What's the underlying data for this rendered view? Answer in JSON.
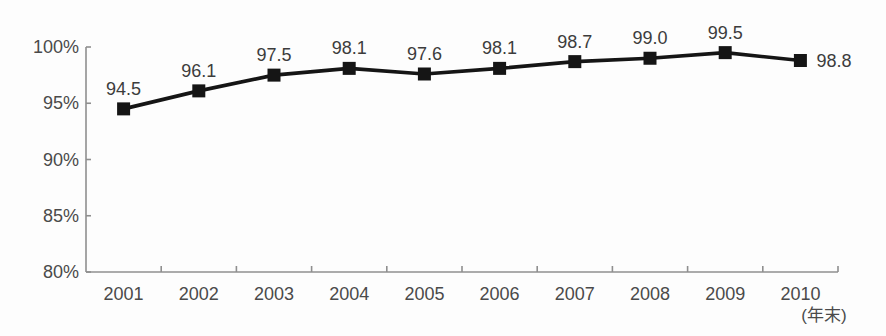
{
  "chart_data": {
    "type": "line",
    "categories": [
      "2001",
      "2002",
      "2003",
      "2004",
      "2005",
      "2006",
      "2007",
      "2008",
      "2009",
      "2010"
    ],
    "values": [
      94.5,
      96.1,
      97.5,
      98.1,
      97.6,
      98.1,
      98.7,
      99.0,
      99.5,
      98.8
    ],
    "data_labels": [
      "94.5",
      "96.1",
      "97.5",
      "98.1",
      "97.6",
      "98.1",
      "98.7",
      "99.0",
      "99.5",
      "98.8"
    ],
    "title": "",
    "xlabel": "(年末)",
    "ylabel": "",
    "ylim": [
      80,
      100
    ],
    "yticks": [
      80,
      85,
      90,
      95,
      100
    ],
    "ytick_labels": [
      "80%",
      "85%",
      "90%",
      "95%",
      "100%"
    ],
    "grid": "off",
    "legend": "none",
    "marker": "square",
    "colors": {
      "line": "#151515",
      "marker": "#151515",
      "axis": "#8f8f8f",
      "tick_text": "#4a4a4a",
      "data_label_text": "#3c3c3c",
      "background": "#fdfdfd"
    }
  }
}
